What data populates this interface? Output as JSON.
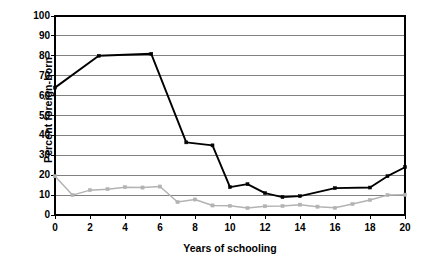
{
  "chart_data": {
    "type": "line",
    "title": "",
    "xlabel": "Years of schooling",
    "ylabel": "Percent foreign-born",
    "xlim": [
      0,
      20
    ],
    "ylim": [
      0,
      100
    ],
    "xticks": [
      0,
      2,
      4,
      6,
      8,
      10,
      12,
      14,
      16,
      18,
      20
    ],
    "yticks": [
      0,
      10,
      20,
      30,
      40,
      50,
      60,
      70,
      80,
      90,
      100
    ],
    "grid": "horizontal",
    "legend": "none",
    "series": [
      {
        "name": "black-series",
        "color": "#000000",
        "marker": "square",
        "points": [
          {
            "x": 0,
            "y": 64
          },
          {
            "x": 2.5,
            "y": 80
          },
          {
            "x": 5.5,
            "y": 81
          },
          {
            "x": 7.5,
            "y": 36.5
          },
          {
            "x": 9,
            "y": 35
          },
          {
            "x": 10,
            "y": 14
          },
          {
            "x": 11,
            "y": 15.5
          },
          {
            "x": 12,
            "y": 11
          },
          {
            "x": 13,
            "y": 9
          },
          {
            "x": 14,
            "y": 9.5
          },
          {
            "x": 16,
            "y": 13.5
          },
          {
            "x": 18,
            "y": 13.8
          },
          {
            "x": 19,
            "y": 19.5
          },
          {
            "x": 20,
            "y": 24
          }
        ]
      },
      {
        "name": "gray-series",
        "color": "#b3b3b3",
        "marker": "square",
        "points": [
          {
            "x": 0,
            "y": 19.5
          },
          {
            "x": 1,
            "y": 10
          },
          {
            "x": 2,
            "y": 12.5
          },
          {
            "x": 3,
            "y": 13
          },
          {
            "x": 4,
            "y": 14
          },
          {
            "x": 5,
            "y": 13.8
          },
          {
            "x": 6,
            "y": 14.3
          },
          {
            "x": 7,
            "y": 6.5
          },
          {
            "x": 8,
            "y": 7.8
          },
          {
            "x": 9,
            "y": 4.8
          },
          {
            "x": 10,
            "y": 4.6
          },
          {
            "x": 11,
            "y": 3.5
          },
          {
            "x": 12,
            "y": 4.4
          },
          {
            "x": 13,
            "y": 4.5
          },
          {
            "x": 14,
            "y": 5.2
          },
          {
            "x": 15,
            "y": 4.2
          },
          {
            "x": 16,
            "y": 3.6
          },
          {
            "x": 17,
            "y": 5.5
          },
          {
            "x": 18,
            "y": 7.5
          },
          {
            "x": 19,
            "y": 10
          },
          {
            "x": 20,
            "y": 10.2
          }
        ]
      }
    ]
  },
  "axes": {
    "ylabel_text": "Percent foreign-born",
    "xlabel_text": "Years of schooling",
    "ytick_labels": [
      "100",
      "90",
      "80",
      "70",
      "60",
      "50",
      "40",
      "30",
      "20",
      "10",
      "0"
    ],
    "xtick_labels": [
      "0",
      "2",
      "4",
      "6",
      "8",
      "10",
      "12",
      "14",
      "16",
      "18",
      "20"
    ]
  },
  "colors": {
    "series_black": "#000000",
    "series_gray": "#b3b3b3",
    "gridline": "#808080",
    "axis": "#000000",
    "background": "#ffffff"
  }
}
